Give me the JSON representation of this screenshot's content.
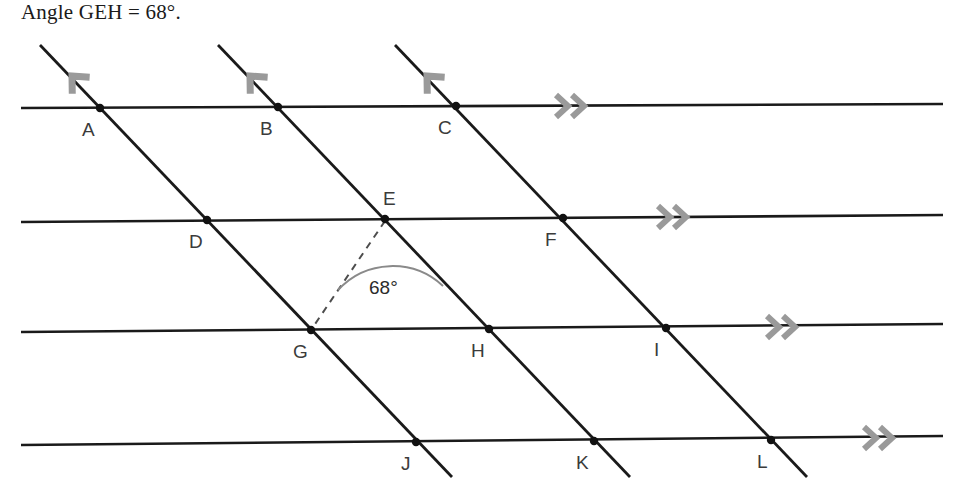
{
  "title": "Angle GEH = 68°.",
  "diagram": {
    "type": "geometry-parallel-lines",
    "canvas": {
      "width": 961,
      "height": 496
    },
    "colors": {
      "line": "#1a1a1a",
      "arrow_marker": "#9a9a9a",
      "label": "#3b3b3b",
      "dashed": "#4d4d4d",
      "arc": "#7a7a7a",
      "background": "#ffffff"
    },
    "angle": {
      "value_label": "68°",
      "vertex": "E",
      "rays": [
        "G",
        "H"
      ],
      "label_x": 393,
      "label_y": 288,
      "arc_radius": 72
    },
    "horizontal_lines": [
      {
        "id": "h1",
        "x1": 21,
        "y1": 108,
        "x2": 943,
        "y2": 104,
        "marker_x": 570,
        "marker_y": 106
      },
      {
        "id": "h2",
        "x1": 21,
        "y1": 222,
        "x2": 943,
        "y2": 215,
        "marker_x": 672,
        "marker_y": 217
      },
      {
        "id": "h3",
        "x1": 21,
        "y1": 332,
        "x2": 943,
        "y2": 324,
        "marker_x": 781,
        "marker_y": 327
      },
      {
        "id": "h4",
        "x1": 21,
        "y1": 445,
        "x2": 943,
        "y2": 436,
        "marker_x": 878,
        "marker_y": 438
      }
    ],
    "diagonal_lines": [
      {
        "id": "d1",
        "x1": 40,
        "y1": 45,
        "x2": 452,
        "y2": 477,
        "marker_x": 72,
        "marker_y": 76
      },
      {
        "id": "d2",
        "x1": 218,
        "y1": 45,
        "x2": 630,
        "y2": 477,
        "marker_x": 250,
        "marker_y": 76
      },
      {
        "id": "d3",
        "x1": 395,
        "y1": 45,
        "x2": 807,
        "y2": 477,
        "marker_x": 427,
        "marker_y": 76
      }
    ],
    "points": [
      {
        "label": "A",
        "x": 100,
        "y": 108,
        "label_x": 82,
        "label_y": 136,
        "anchor": "below-left"
      },
      {
        "label": "B",
        "x": 278,
        "y": 107,
        "label_x": 260,
        "label_y": 135,
        "anchor": "below-left"
      },
      {
        "label": "C",
        "x": 456,
        "y": 106,
        "label_x": 438,
        "label_y": 134,
        "anchor": "below-left"
      },
      {
        "label": "D",
        "x": 207,
        "y": 220,
        "label_x": 189,
        "label_y": 248,
        "anchor": "below-left"
      },
      {
        "label": "E",
        "x": 385,
        "y": 219,
        "label_x": 383,
        "label_y": 205,
        "anchor": "above-right"
      },
      {
        "label": "F",
        "x": 563,
        "y": 218,
        "label_x": 545,
        "label_y": 246,
        "anchor": "below-left"
      },
      {
        "label": "G",
        "x": 311,
        "y": 330,
        "label_x": 293,
        "label_y": 358,
        "anchor": "below-left"
      },
      {
        "label": "H",
        "x": 489,
        "y": 329,
        "label_x": 471,
        "label_y": 357,
        "anchor": "below-left"
      },
      {
        "label": "I",
        "x": 666,
        "y": 328,
        "label_x": 651,
        "label_y": 356,
        "anchor": "below-left"
      },
      {
        "label": "J",
        "x": 416,
        "y": 442,
        "label_x": 400,
        "label_y": 470,
        "anchor": "below-left"
      },
      {
        "label": "K",
        "x": 594,
        "y": 441,
        "label_x": 576,
        "label_y": 469,
        "anchor": "below-left"
      },
      {
        "label": "L",
        "x": 771,
        "y": 440,
        "label_x": 755,
        "label_y": 468,
        "anchor": "below-left"
      }
    ],
    "dashed_segment": {
      "from": "E",
      "to": "G",
      "x1": 385,
      "y1": 219,
      "x2": 311,
      "y2": 330
    }
  }
}
